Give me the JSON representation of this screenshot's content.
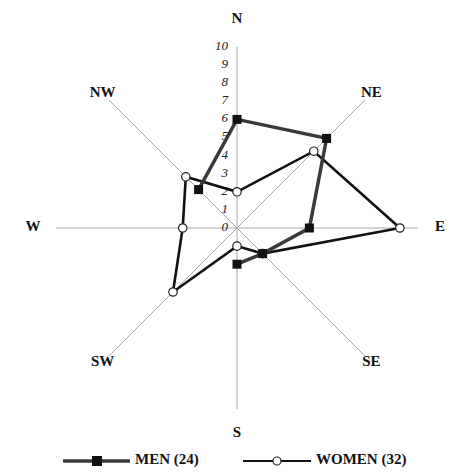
{
  "chart_data": {
    "type": "radar",
    "title": "",
    "axes": [
      "N",
      "NE",
      "E",
      "SE",
      "S",
      "SW",
      "W",
      "NW"
    ],
    "radial_ticks": [
      "0",
      "1",
      "2",
      "3",
      "4",
      "5",
      "6",
      "7",
      "8",
      "9",
      "10"
    ],
    "rlim": [
      0,
      10
    ],
    "grid": false,
    "legend_position": "bottom",
    "series": [
      {
        "name": "MEN (24)",
        "values": [
          6,
          7,
          4,
          2,
          2,
          0,
          0,
          3
        ],
        "marker": "filled-square",
        "color": "#3a3a3a",
        "drawn_segments": "NW-N-NE-E-SE-S"
      },
      {
        "name": "WOMEN (32)",
        "values": [
          2,
          6,
          9,
          2,
          1,
          5,
          3,
          4
        ],
        "marker": "open-circle",
        "color": "#111111"
      }
    ]
  }
}
